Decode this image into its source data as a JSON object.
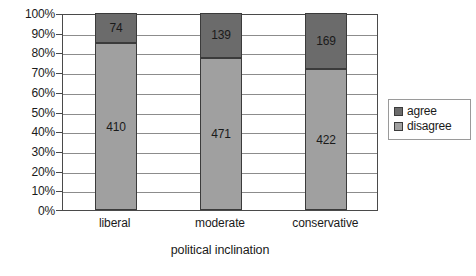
{
  "chart_data": {
    "type": "bar",
    "subtype": "100% stacked column",
    "title": "",
    "xlabel": "political inclination",
    "ylabel": "",
    "categories": [
      "liberal",
      "moderate",
      "conservative"
    ],
    "series": [
      {
        "name": "agree",
        "values": [
          74,
          139,
          169
        ],
        "color": "#6b6b6b"
      },
      {
        "name": "disagree",
        "values": [
          410,
          471,
          422
        ],
        "color": "#a0a0a0"
      }
    ],
    "stack_order_top_to_bottom": [
      "agree",
      "disagree"
    ],
    "totals": [
      484,
      610,
      591
    ],
    "percent_shares": {
      "liberal": {
        "agree": 15.3,
        "disagree": 84.7
      },
      "moderate": {
        "agree": 22.8,
        "disagree": 77.2
      },
      "conservative": {
        "agree": 28.6,
        "disagree": 71.4
      }
    },
    "ylim": [
      0,
      100
    ],
    "y_tick_labels": [
      "100%",
      "90%",
      "80%",
      "70%",
      "60%",
      "50%",
      "40%",
      "30%",
      "20%",
      "10%",
      "0%"
    ],
    "y_tick_values": [
      100,
      90,
      80,
      70,
      60,
      50,
      40,
      30,
      20,
      10,
      0
    ],
    "grid": true,
    "legend_position": "right",
    "legend_entries": [
      "agree",
      "disagree"
    ]
  },
  "axes": {
    "x_title": "political inclination"
  },
  "legend": {
    "items": [
      {
        "label": "agree"
      },
      {
        "label": "disagree"
      }
    ]
  },
  "bars": [
    {
      "category": "liberal",
      "agree_label": "74",
      "disagree_label": "410",
      "agree_pct": 15.289,
      "disagree_pct": 84.711
    },
    {
      "category": "moderate",
      "agree_label": "139",
      "disagree_label": "471",
      "agree_pct": 22.787,
      "disagree_pct": 77.213
    },
    {
      "category": "conservative",
      "agree_label": "169",
      "disagree_label": "422",
      "agree_pct": 28.596,
      "disagree_pct": 71.404
    }
  ],
  "colors": {
    "agree": "#6b6b6b",
    "disagree": "#a0a0a0",
    "bar_border": "#3b3b3b",
    "axis": "#4a4a4a",
    "gridline": "#8c8c8c",
    "legend_border": "#9a9a9a",
    "background": "#ffffff"
  }
}
